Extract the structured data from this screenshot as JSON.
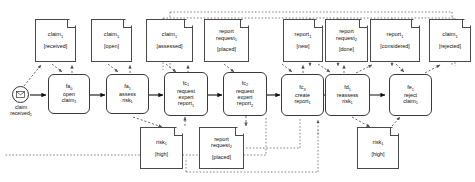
{
  "diagram": {
    "type": "object-centric-process-model",
    "start_event": {
      "icon": "envelope-icon",
      "label_line1": "claim",
      "label_line2": "received",
      "label_sub": "1"
    },
    "activities": [
      {
        "id": "fa",
        "id_sub": "0",
        "lines": [
          "open",
          "claim"
        ],
        "line_subs": [
          "",
          "1"
        ]
      },
      {
        "id": "fa",
        "id_sub": "1",
        "lines": [
          "assess",
          "risk"
        ],
        "line_subs": [
          "",
          "1"
        ]
      },
      {
        "id": "fc",
        "id_sub": "1",
        "lines": [
          "request",
          "expert",
          "report"
        ],
        "line_subs": [
          "",
          "",
          "1"
        ]
      },
      {
        "id": "fc",
        "id_sub": "2",
        "lines": [
          "request",
          "expert",
          "report"
        ],
        "line_subs": [
          "",
          "",
          "2"
        ]
      },
      {
        "id": "fc",
        "id_sub": "3",
        "lines": [
          "create",
          "report"
        ],
        "line_subs": [
          "",
          "1"
        ]
      },
      {
        "id": "fd",
        "id_sub": "1",
        "lines": [
          "reassess",
          "risk"
        ],
        "line_subs": [
          "",
          "1"
        ]
      },
      {
        "id": "fe",
        "id_sub": "1",
        "lines": [
          "reject",
          "claim"
        ],
        "line_subs": [
          "",
          "1"
        ]
      }
    ],
    "objects_top": [
      {
        "name": "claim",
        "name_sub": "1",
        "state": "[received]"
      },
      {
        "name": "claim",
        "name_sub": "1",
        "state": "[open]"
      },
      {
        "name": "claim",
        "name_sub": "1",
        "state": "[assessed]"
      },
      {
        "name": "report",
        "name_sub": "",
        "name2": "request",
        "name2_sub": "1",
        "state": "[placed]"
      },
      {
        "name": "report",
        "name_sub": "1",
        "state": "[new]"
      },
      {
        "name": "report",
        "name_sub": "",
        "name2": "request",
        "name2_sub": "2",
        "state": "[done]"
      },
      {
        "name": "report",
        "name_sub": "1",
        "state": "[considered]"
      },
      {
        "name": "claim",
        "name_sub": "1",
        "state": "[rejected]"
      }
    ],
    "objects_bottom": [
      {
        "name": "risk",
        "name_sub": "1",
        "state": "[high]"
      },
      {
        "name": "report",
        "name_sub": "",
        "name2": "request",
        "name2_sub": "2",
        "state": "[placed]"
      },
      {
        "name": "risk",
        "name_sub": "1",
        "state": "[high]"
      }
    ]
  },
  "colors": {
    "node_stroke": "#3a3a3a",
    "doc_stroke": "#4a4a4a",
    "flow_stroke": "#1a1a1a",
    "assoc_stroke": "#555555",
    "background": "#ffffff"
  }
}
